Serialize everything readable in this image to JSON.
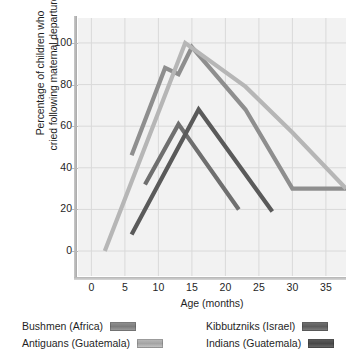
{
  "chart_data": {
    "type": "line",
    "title": "",
    "xlabel": "Age (months)",
    "ylabel": "Percentage of children who\ncried following maternal departure",
    "xlim": [
      -2,
      38
    ],
    "ylim": [
      -12,
      112
    ],
    "xticks": [
      0,
      5,
      10,
      15,
      20,
      25,
      30,
      35
    ],
    "yticks": [
      0,
      20,
      40,
      60,
      80,
      100
    ],
    "grid": true,
    "legend_position": "below-plot",
    "series": [
      {
        "name": "Bushmen (Africa)",
        "color": "#8e8e8e",
        "x": [
          6,
          11,
          13,
          15,
          23,
          30,
          38
        ],
        "y": [
          46,
          88,
          85,
          98,
          68,
          30,
          30
        ]
      },
      {
        "name": "Antiguans (Guatemala)",
        "color": "#b6b6b6",
        "x": [
          2,
          14,
          23,
          30,
          38
        ],
        "y": [
          0,
          100,
          79,
          57,
          30
        ]
      },
      {
        "name": "Kibbutzniks (Israel)",
        "color": "#6f6f6f",
        "x": [
          8,
          13,
          22
        ],
        "y": [
          32,
          61,
          20
        ]
      },
      {
        "name": "Indians (Guatemala)",
        "color": "#5a5a5a",
        "x": [
          6,
          16,
          27
        ],
        "y": [
          8,
          68,
          19
        ]
      }
    ]
  },
  "legend": {
    "entries": [
      {
        "label": "Bushmen (Africa)",
        "color": "#8e8e8e"
      },
      {
        "label": "Antiguans (Guatemala)",
        "color": "#b6b6b6"
      },
      {
        "label": "Kibbutzniks (Israel)",
        "color": "#6f6f6f"
      },
      {
        "label": "Indians (Guatemala)",
        "color": "#5a5a5a"
      }
    ]
  }
}
